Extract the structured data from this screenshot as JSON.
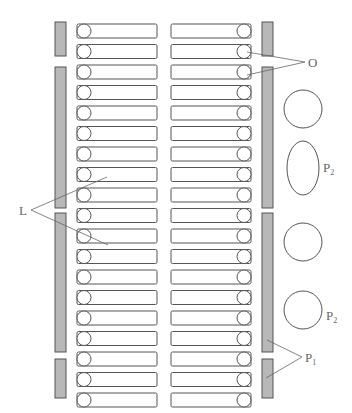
{
  "diagram": {
    "rows": 19,
    "row_top": 24,
    "row_pitch": 20.5,
    "row_height": 14,
    "left_column": {
      "x": 77,
      "width": 80,
      "circle_side": "left"
    },
    "right_column": {
      "x": 171,
      "width": 80,
      "circle_side": "right"
    },
    "left_bars": [
      [
        22,
        56
      ],
      [
        67,
        208
      ],
      [
        213,
        352
      ],
      [
        359,
        398
      ]
    ],
    "right_bars": [
      [
        22,
        56
      ],
      [
        67,
        208
      ],
      [
        213,
        352
      ],
      [
        359,
        398
      ]
    ],
    "shapes": [
      {
        "type": "circle",
        "cx": 303,
        "cy": 109,
        "rx": 19,
        "ry": 19
      },
      {
        "type": "ellipse",
        "cx": 303,
        "cy": 168,
        "rx": 16,
        "ry": 27
      },
      {
        "type": "circle",
        "cx": 303,
        "cy": 242,
        "rx": 19,
        "ry": 19
      },
      {
        "type": "circle",
        "cx": 303,
        "cy": 310,
        "rx": 19,
        "ry": 19
      }
    ],
    "colors": {
      "bar_fill": "#b8b8b8",
      "bar_stroke": "#555555",
      "line": "#555555",
      "label": "#666666"
    }
  },
  "labels": {
    "O": {
      "text": "O",
      "sub": ""
    },
    "L": {
      "text": "L",
      "sub": ""
    },
    "P2_top": {
      "text": "P",
      "sub": "2"
    },
    "P2_bottom": {
      "text": "P",
      "sub": "2"
    },
    "P1": {
      "text": "P",
      "sub": "1"
    }
  }
}
